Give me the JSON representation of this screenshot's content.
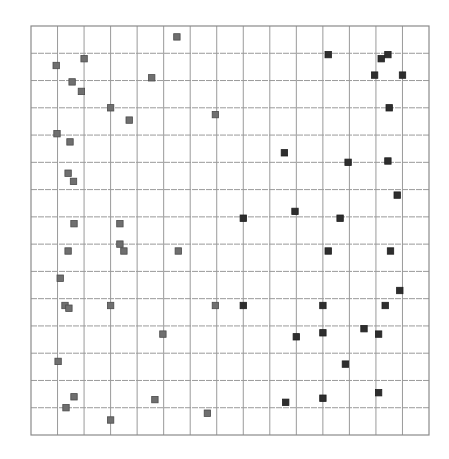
{
  "chart_data": {
    "type": "scatter",
    "title": "",
    "xlabel": "",
    "ylabel": "",
    "grid": true,
    "legend": null,
    "grid_cells": {
      "columns": 15,
      "rows": 15
    },
    "xlim": [
      0,
      15
    ],
    "ylim": [
      0,
      15
    ],
    "colors": {
      "grid": "#9a9a9a",
      "border": "#8a8a8a",
      "series_a_fill": "#6f6f6f",
      "series_a_stroke": "#4a4a4a",
      "series_b_fill": "#2e2e2e",
      "series_b_stroke": "#1e1e1e"
    },
    "series": [
      {
        "name": "gray",
        "marker": "square",
        "points": [
          [
            5.5,
            14.6
          ],
          [
            2.0,
            13.8
          ],
          [
            0.95,
            13.55
          ],
          [
            1.55,
            12.95
          ],
          [
            1.9,
            12.6
          ],
          [
            4.55,
            13.1
          ],
          [
            3.0,
            12.0
          ],
          [
            3.7,
            11.55
          ],
          [
            6.95,
            11.75
          ],
          [
            0.98,
            11.05
          ],
          [
            1.47,
            10.75
          ],
          [
            1.4,
            9.6
          ],
          [
            1.6,
            9.3
          ],
          [
            1.62,
            7.75
          ],
          [
            3.35,
            7.75
          ],
          [
            3.35,
            7.0
          ],
          [
            3.5,
            6.75
          ],
          [
            1.4,
            6.75
          ],
          [
            5.55,
            6.75
          ],
          [
            1.1,
            5.75
          ],
          [
            1.28,
            4.75
          ],
          [
            1.43,
            4.65
          ],
          [
            3.0,
            4.75
          ],
          [
            6.95,
            4.75
          ],
          [
            4.97,
            3.7
          ],
          [
            1.02,
            2.7
          ],
          [
            1.62,
            1.4
          ],
          [
            1.32,
            1.0
          ],
          [
            4.67,
            1.3
          ],
          [
            6.65,
            0.8
          ],
          [
            3.0,
            0.55
          ]
        ]
      },
      {
        "name": "dark",
        "marker": "square",
        "points": [
          [
            11.2,
            13.95
          ],
          [
            13.2,
            13.8
          ],
          [
            13.45,
            13.95
          ],
          [
            12.95,
            13.2
          ],
          [
            14.0,
            13.2
          ],
          [
            13.5,
            12.0
          ],
          [
            9.55,
            10.35
          ],
          [
            11.95,
            10.0
          ],
          [
            13.45,
            10.05
          ],
          [
            13.8,
            8.8
          ],
          [
            9.95,
            8.2
          ],
          [
            11.65,
            7.95
          ],
          [
            8.0,
            7.95
          ],
          [
            11.2,
            6.75
          ],
          [
            13.55,
            6.75
          ],
          [
            13.9,
            5.3
          ],
          [
            8.0,
            4.75
          ],
          [
            11.0,
            4.75
          ],
          [
            13.35,
            4.75
          ],
          [
            10.0,
            3.6
          ],
          [
            11.0,
            3.75
          ],
          [
            12.55,
            3.9
          ],
          [
            13.1,
            3.7
          ],
          [
            11.85,
            2.6
          ],
          [
            9.6,
            1.2
          ],
          [
            11.0,
            1.35
          ],
          [
            13.1,
            1.55
          ]
        ]
      }
    ]
  },
  "plot": {
    "left": 31,
    "top": 26,
    "right": 429,
    "bottom": 435
  }
}
